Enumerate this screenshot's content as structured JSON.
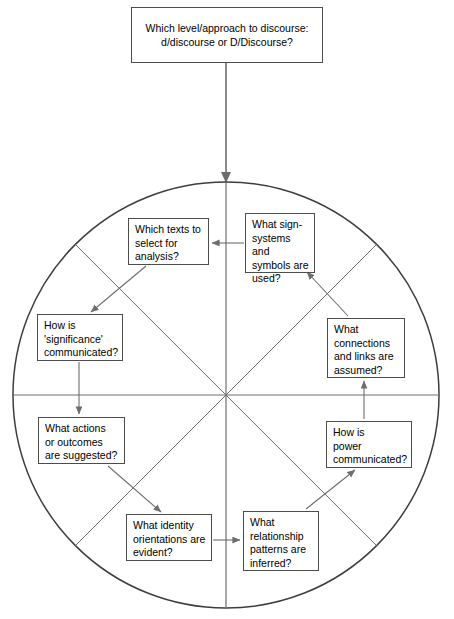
{
  "diagram": {
    "type": "cycle-wheel",
    "title_box": {
      "id": "title",
      "text": "Which level/approach to discourse:\nd/discourse or D/Discourse?",
      "x": 131,
      "y": 7,
      "w": 192,
      "h": 56
    },
    "circle": {
      "cx": 226,
      "cy": 395,
      "r": 213,
      "stroke": "#3d3d3d",
      "spokes": 8,
      "spoke_stroke": "#6e6e6e"
    },
    "entry_arrow": {
      "from_x": 226,
      "from_y": 63,
      "to_x": 226,
      "to_y": 182,
      "stroke": "#6e6e6e"
    },
    "nodes": [
      {
        "id": "sign-systems",
        "name": "what-sign-systems-box",
        "text": "What sign-\nsystems and\nsymbols are\nused?",
        "x": 245,
        "y": 213,
        "w": 70,
        "h": 60,
        "sector": "north-east"
      },
      {
        "id": "which-texts",
        "name": "which-texts-box",
        "text": "Which texts to\nselect for\nanalysis?",
        "x": 128,
        "y": 218,
        "w": 81,
        "h": 47,
        "sector": "north-west"
      },
      {
        "id": "significance",
        "name": "how-significance-box",
        "text": "How is\n'significance'\ncommunicated?",
        "x": 37,
        "y": 314,
        "w": 86,
        "h": 47,
        "sector": "west-upper"
      },
      {
        "id": "connections",
        "name": "what-connections-box",
        "text": "What\nconnections\nand links are\nassumed?",
        "x": 327,
        "y": 318,
        "w": 78,
        "h": 60,
        "sector": "east-upper"
      },
      {
        "id": "actions",
        "name": "what-actions-box",
        "text": "What actions\nor outcomes\nare suggested?",
        "x": 38,
        "y": 417,
        "w": 87,
        "h": 47,
        "sector": "west-lower"
      },
      {
        "id": "power",
        "name": "how-power-box",
        "text": "How is\npower\ncommunicated?",
        "x": 326,
        "y": 421,
        "w": 86,
        "h": 47,
        "sector": "east-lower"
      },
      {
        "id": "identity",
        "name": "what-identity-box",
        "text": "What identity\norientations are\nevident?",
        "x": 126,
        "y": 514,
        "w": 86,
        "h": 47,
        "sector": "south-west"
      },
      {
        "id": "relationships",
        "name": "what-relationship-box",
        "text": "What\nrelationship\npatterns are\ninferred?",
        "x": 243,
        "y": 511,
        "w": 76,
        "h": 60,
        "sector": "south-east"
      }
    ],
    "flow_arrows": [
      {
        "id": "sign-to-texts",
        "from": "sign-systems",
        "to": "which-texts",
        "x1": 244,
        "y1": 243,
        "x2": 212,
        "y2": 243
      },
      {
        "id": "texts-to-significance",
        "from": "which-texts",
        "to": "significance",
        "x1": 146,
        "y1": 266,
        "x2": 91,
        "y2": 312
      },
      {
        "id": "significance-to-actions",
        "from": "significance",
        "to": "actions",
        "x1": 79,
        "y1": 362,
        "x2": 79,
        "y2": 414
      },
      {
        "id": "actions-to-identity",
        "from": "actions",
        "to": "identity",
        "x1": 108,
        "y1": 466,
        "x2": 161,
        "y2": 512
      },
      {
        "id": "identity-to-relationships",
        "from": "identity",
        "to": "relationships",
        "x1": 213,
        "y1": 540,
        "x2": 240,
        "y2": 540
      },
      {
        "id": "relationships-to-power",
        "from": "relationships",
        "to": "power",
        "x1": 306,
        "y1": 509,
        "x2": 355,
        "y2": 470
      },
      {
        "id": "power-to-connections",
        "from": "power",
        "to": "connections",
        "x1": 364,
        "y1": 419,
        "x2": 364,
        "y2": 381
      },
      {
        "id": "connections-to-sign",
        "from": "connections",
        "to": "sign-systems",
        "x1": 348,
        "y1": 316,
        "x2": 307,
        "y2": 272
      }
    ]
  },
  "colors": {
    "box_border": "#4c4c4c",
    "circle_stroke": "#3d3d3d",
    "spoke_stroke": "#6e6e6e",
    "arrow_stroke": "#6e6e6e",
    "text": "#000000",
    "background": "#ffffff"
  }
}
